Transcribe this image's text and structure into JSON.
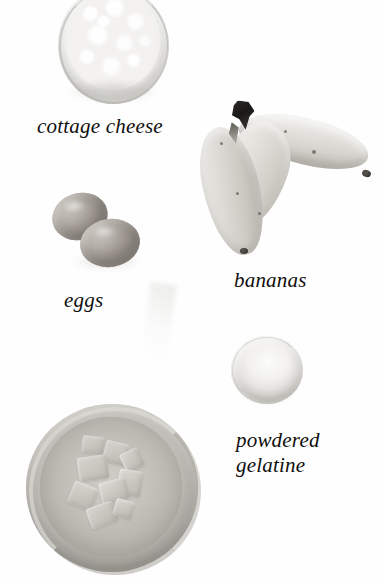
{
  "page": {
    "background_color": "#fefefe",
    "width": 385,
    "height": 578,
    "style": "black-and-white photographic ingredient plate with handwritten-style italic serif captions"
  },
  "labels": {
    "cottage_cheese": "cottage cheese",
    "eggs": "eggs",
    "bananas": "bananas",
    "powdered_gelatine": "powdered\ngelatine"
  },
  "objects": [
    {
      "name": "cottage-cheese-bowl",
      "caption": "cottage cheese",
      "description": "round white bowl heaped with lumpy white curds, cropped by the top edge of the frame",
      "color": "#f6f5f3"
    },
    {
      "name": "eggs",
      "caption": "eggs",
      "description": "two overlapping oval eggs, medium grey-brown, arranged diagonally",
      "color": "#aca7a0"
    },
    {
      "name": "bananas",
      "caption": "bananas",
      "description": "two pale bananas joined at a dark crown stem, one curving right, one curving down-left",
      "color": "#dddbd6",
      "stem_color": "#211f1c"
    },
    {
      "name": "powdered-gelatine-mound",
      "caption": "powdered gelatine",
      "description": "small circular mound of fine pale powder",
      "color": "#eeedea"
    },
    {
      "name": "fruit-cubes-bowl",
      "caption": "",
      "description": "wide shallow glass bowl filled with chopped pale fruit cubes",
      "color": "#c5c2bc"
    }
  ]
}
